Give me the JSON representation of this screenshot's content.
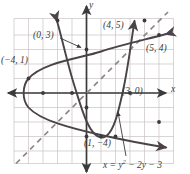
{
  "figure": {
    "kind": "coordinate-graph",
    "axis_labels": {
      "x": "x",
      "y": "y"
    },
    "equation": {
      "prefix": "x = y",
      "exponent": "2",
      "suffix": " − 2y − 3"
    },
    "equation_plain": "x = y² − 2y − 3",
    "colors": {
      "grid": "#c9c2c6",
      "axis": "#3b3b3b",
      "curve": "#4a4449",
      "dashed": "#8d868c",
      "text": "#3b3b3b",
      "background": "#ffffff"
    },
    "grid": {
      "x_min": -5,
      "x_max": 6,
      "y_min": -6,
      "y_max": 4,
      "cell_px": 14.5,
      "visible": true
    },
    "point_labels": [
      {
        "id": "pt-0-3",
        "text": "(0, 3)",
        "x": 34,
        "y": 35
      },
      {
        "id": "pt-4-5",
        "text": "(4, 5)",
        "x": 104,
        "y": 25
      },
      {
        "id": "pt-5-4",
        "text": "(5, 4)",
        "x": 148,
        "y": 47
      },
      {
        "id": "pt-m4-1",
        "text": "(−4, 1)",
        "x": 2,
        "y": 59
      },
      {
        "id": "pt-3-0",
        "text": "(3, 0)",
        "x": 124,
        "y": 90
      },
      {
        "id": "pt-1-m4",
        "text": "(1, −4)",
        "x": 85,
        "y": 139
      }
    ],
    "curves": [
      {
        "id": "parabola-horizontal",
        "equation": "x = y² − 2y − 3",
        "opens": "right",
        "vertex": [
          -4,
          1
        ],
        "points": [
          [
            -4,
            1
          ],
          [
            -3,
            0
          ],
          [
            0,
            3
          ],
          [
            0,
            -1
          ],
          [
            5,
            4
          ],
          [
            5,
            -2
          ]
        ]
      },
      {
        "id": "parabola-vertical",
        "equation": "y = x² − 2x − 3",
        "opens": "up",
        "vertex": [
          1,
          -4
        ],
        "points": [
          [
            1,
            -4
          ],
          [
            0,
            -3
          ],
          [
            3,
            0
          ],
          [
            -1,
            0
          ],
          [
            4,
            5
          ],
          [
            -2,
            5
          ]
        ]
      },
      {
        "id": "line-y-equals-x",
        "equation": "y = x",
        "style": "dashed"
      }
    ]
  }
}
